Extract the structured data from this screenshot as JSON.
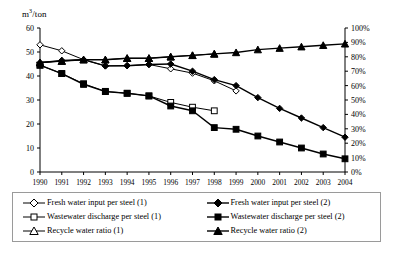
{
  "axis": {
    "y_left_label": "m3/ton",
    "y_left_label_base": "m",
    "y_left_label_sup": "3",
    "y_left_label_rest": "/ton",
    "y_left_ticks": [
      "0",
      "10",
      "20",
      "30",
      "40",
      "50",
      "60"
    ],
    "y_right_ticks": [
      "0%",
      "10%",
      "20%",
      "30%",
      "40%",
      "50%",
      "60%",
      "70%",
      "80%",
      "90%",
      "100%"
    ],
    "x_ticks": [
      "1990",
      "1991",
      "1992",
      "1993",
      "1994",
      "1995",
      "1996",
      "1997",
      "1998",
      "1999",
      "2000",
      "2001",
      "2002",
      "2003",
      "2004"
    ]
  },
  "legend": {
    "left_column": [
      {
        "label": "Fresh water input per steel (1)",
        "marker": "diamond-open-icon"
      },
      {
        "label": "Wastewater discharge per steel (1)",
        "marker": "square-open-icon"
      },
      {
        "label": "Recycle water ratio (1)",
        "marker": "triangle-open-icon"
      }
    ],
    "right_column": [
      {
        "label": "Fresh water input per steel (2)",
        "marker": "diamond-filled-icon"
      },
      {
        "label": "Wastewater discharge per steel (2)",
        "marker": "square-filled-icon"
      },
      {
        "label": "Recycle water ratio (2)",
        "marker": "triangle-filled-icon"
      }
    ]
  },
  "chart_data": {
    "type": "line",
    "title": "",
    "xlabel": "",
    "ylabel": "m3/ton",
    "y2label": "",
    "grid": false,
    "legend_position": "bottom",
    "x": [
      "1990",
      "1991",
      "1992",
      "1993",
      "1994",
      "1995",
      "1996",
      "1997",
      "1998",
      "1999",
      "2000",
      "2001",
      "2002",
      "2003",
      "2004"
    ],
    "ylim": [
      0,
      60
    ],
    "y2lim": [
      0,
      100
    ],
    "series": [
      {
        "name": "Fresh water input per steel (1)",
        "axis": "left",
        "marker": "diamond-open",
        "fill": "white",
        "values": [
          53.0,
          50.5,
          46.8,
          44.2,
          44.3,
          44.8,
          43.0,
          41.2,
          38.0,
          33.8,
          null,
          null,
          null,
          null,
          null
        ]
      },
      {
        "name": "Wastewater discharge per steel (1)",
        "axis": "left",
        "marker": "square-open",
        "fill": "white",
        "values": [
          44.5,
          41.0,
          36.8,
          33.6,
          32.8,
          31.7,
          29.0,
          27.0,
          25.5,
          null,
          null,
          null,
          null,
          null,
          null
        ]
      },
      {
        "name": "Recycle water ratio (1)",
        "axis": "right",
        "marker": "triangle-open",
        "fill": "white",
        "values": [
          76,
          77,
          78,
          78,
          79,
          79,
          80,
          81,
          82,
          null,
          null,
          null,
          null,
          null,
          null
        ]
      },
      {
        "name": "Fresh water input per steel (2)",
        "axis": "left",
        "marker": "diamond-filled",
        "fill": "black",
        "values": [
          45.5,
          46.5,
          46.8,
          44.2,
          44.3,
          44.8,
          45.0,
          42.0,
          38.5,
          36.0,
          31.0,
          26.5,
          22.5,
          18.5,
          14.5
        ]
      },
      {
        "name": "Wastewater discharge per steel (2)",
        "axis": "left",
        "marker": "square-filled",
        "fill": "black",
        "values": [
          44.5,
          41.0,
          36.5,
          33.5,
          32.8,
          31.7,
          27.5,
          25.5,
          18.5,
          17.8,
          15.0,
          12.5,
          10.0,
          7.5,
          5.5
        ]
      },
      {
        "name": "Recycle water ratio (2)",
        "axis": "right",
        "marker": "triangle-filled",
        "fill": "black",
        "values": [
          76,
          77,
          78,
          78,
          79,
          79,
          80,
          81,
          82,
          83,
          85,
          86,
          87,
          88,
          89
        ]
      }
    ]
  }
}
